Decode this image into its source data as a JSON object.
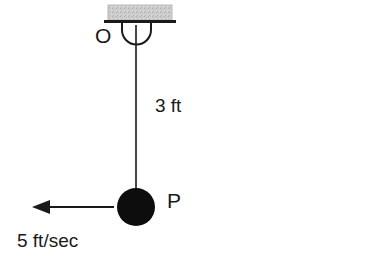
{
  "figure": {
    "type": "physics-pendulum-diagram",
    "background_color": "#ffffff",
    "stroke_color": "#1a1a1a",
    "ceiling_fill_color": "#cccccc"
  },
  "labels": {
    "pivot": "O",
    "length": "3 ft",
    "bob": "P",
    "velocity": "5 ft/sec"
  },
  "elements": {
    "ceiling": {
      "name": "hatched-ceiling-support",
      "x": 108,
      "y": 5,
      "width": 64,
      "height": 15
    },
    "ceiling_line": {
      "name": "ceiling-base-line",
      "x1": 104,
      "y1": 21,
      "x2": 176,
      "y2": 21
    },
    "bracket": {
      "name": "u-bracket",
      "left": 122,
      "right": 151,
      "top": 21,
      "bottom": 39
    },
    "string": {
      "name": "pendulum-string",
      "x": 136,
      "y_top": 25,
      "y_bottom": 207
    },
    "bob": {
      "name": "pendulum-bob",
      "cx": 136,
      "cy": 207,
      "r": 19,
      "fill": "#0d0d0d"
    },
    "velocity_arrow": {
      "name": "velocity-arrow",
      "x_tail": 114,
      "x_head": 32,
      "y": 207,
      "direction": "left"
    }
  }
}
